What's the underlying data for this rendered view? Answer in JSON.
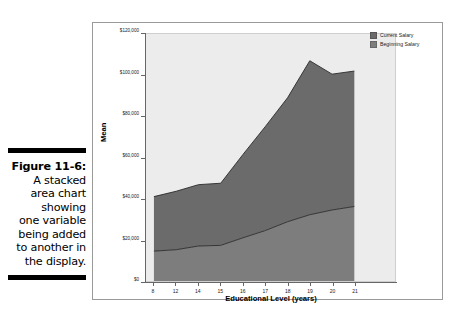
{
  "caption": {
    "lines": [
      {
        "text": "Figure 11-6:",
        "bold": true
      },
      {
        "text": "A stacked",
        "bold": false
      },
      {
        "text": "area chart",
        "bold": false
      },
      {
        "text": "showing",
        "bold": false
      },
      {
        "text": "one variable",
        "bold": false
      },
      {
        "text": "being added",
        "bold": false
      },
      {
        "text": "to another in",
        "bold": false
      },
      {
        "text": "the display.",
        "bold": false
      }
    ]
  },
  "colors": {
    "current_salary": "#6b6b6b",
    "beginning_salary": "#7d7d7d",
    "plot_background": "#ececec",
    "axis": "#666666",
    "frame": "#9a9a9a",
    "caption_rule": "#000000"
  },
  "chart_data": {
    "type": "area",
    "stacked": true,
    "title": "",
    "xlabel": "Educational Level (years)",
    "ylabel": "Mean",
    "categories": [
      "8",
      "12",
      "14",
      "15",
      "16",
      "17",
      "18",
      "19",
      "20",
      "21"
    ],
    "x_tick_labels": [
      "8",
      "12",
      "14",
      "15",
      "16",
      "17",
      "18",
      "19",
      "20",
      "21"
    ],
    "y_tick_labels": [
      "$0",
      "$20,000",
      "$40,000",
      "$60,000",
      "$80,000",
      "$100,000",
      "$120,000"
    ],
    "y_tick_values": [
      0,
      20000,
      40000,
      60000,
      80000,
      100000,
      120000
    ],
    "ylim": [
      0,
      120000
    ],
    "grid": false,
    "legend_position": "top-right",
    "series": [
      {
        "name": "Beginning Salary",
        "color": "#7d7d7d",
        "values": [
          14500,
          15200,
          17000,
          17300,
          21000,
          24500,
          28800,
          32200,
          34500,
          36200
        ]
      },
      {
        "name": "Current Salary",
        "color": "#6b6b6b",
        "values": [
          26500,
          28400,
          29800,
          30200,
          40500,
          50500,
          60200,
          74800,
          66000,
          65800
        ]
      }
    ],
    "stacked_totals": [
      41000,
      43600,
      46800,
      47500,
      61500,
      75000,
      89000,
      107000,
      100500,
      102000
    ]
  },
  "legend": {
    "entries": [
      {
        "label": "Current Salary",
        "color": "#6b6b6b"
      },
      {
        "label": "Beginning Salary",
        "color": "#7d7d7d"
      }
    ]
  }
}
